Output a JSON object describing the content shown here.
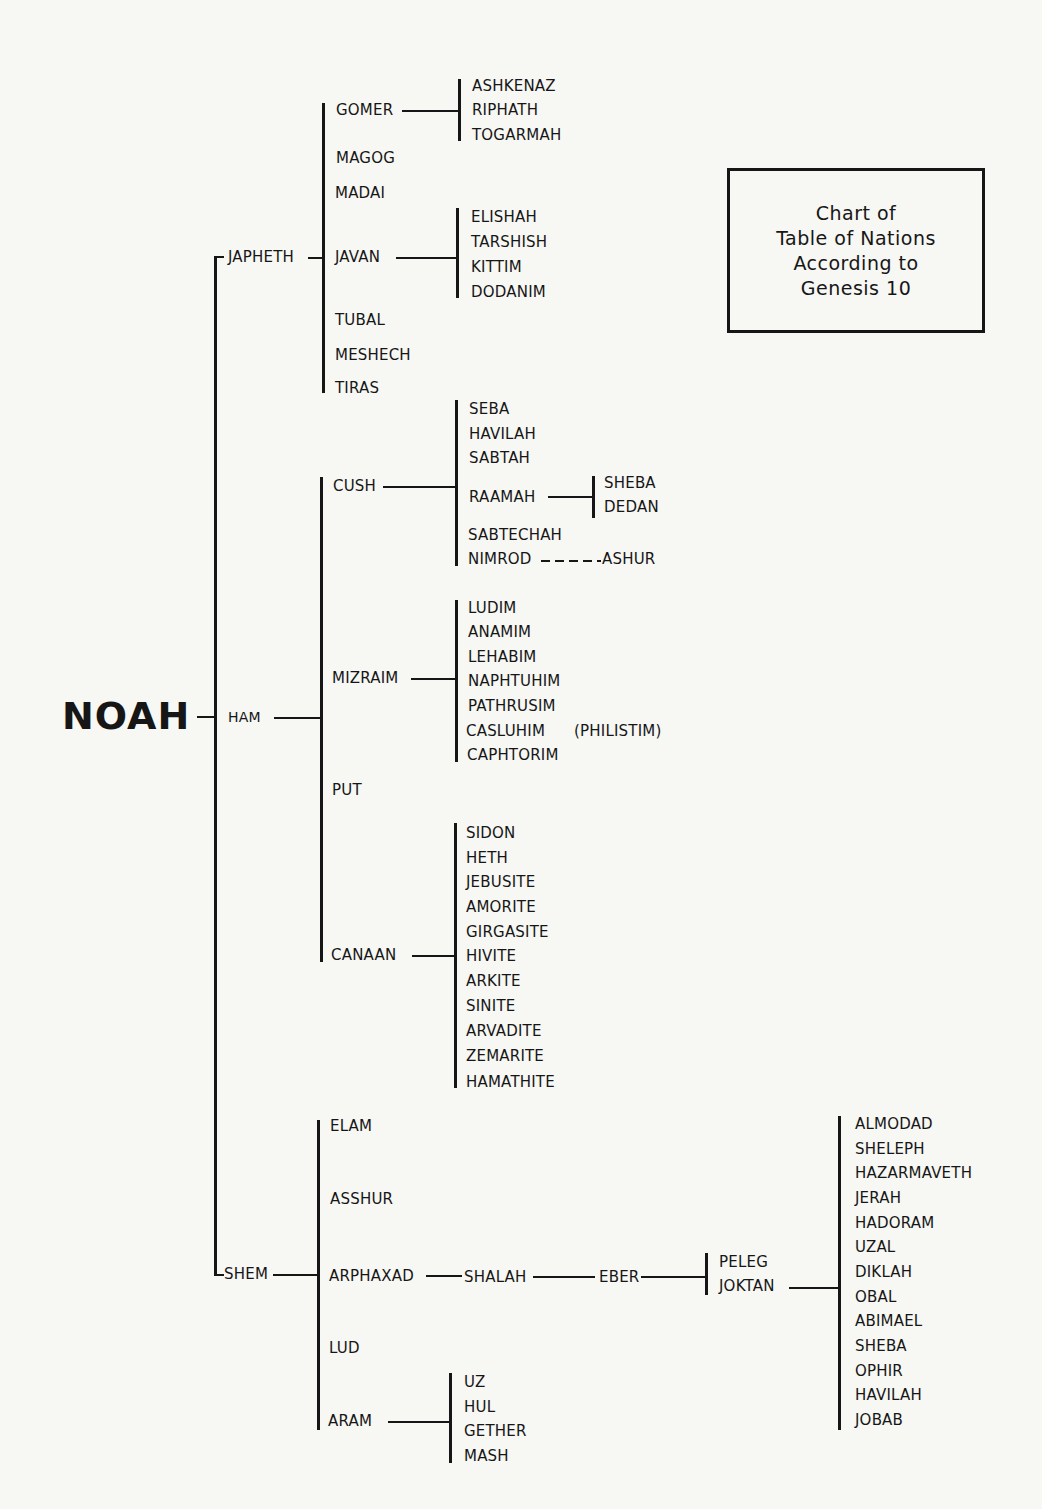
{
  "title_box": {
    "lines": [
      "Chart of",
      "Table of Nations",
      "According to",
      "Genesis 10"
    ]
  },
  "root": "NOAH",
  "sons": {
    "japheth": {
      "name": "JAPHETH",
      "children": {
        "gomer": {
          "name": "GOMER",
          "children": [
            "ASHKENAZ",
            "RIPHATH",
            "TOGARMAH"
          ]
        },
        "magog": {
          "name": "MAGOG"
        },
        "madai": {
          "name": "MADAI"
        },
        "javan": {
          "name": "JAVAN",
          "children": [
            "ELISHAH",
            "TARSHISH",
            "KITTIM",
            "DODANIM"
          ]
        },
        "tubal": {
          "name": "TUBAL"
        },
        "meshech": {
          "name": "MESHECH"
        },
        "tiras": {
          "name": "TIRAS"
        }
      }
    },
    "ham": {
      "name": "HAM",
      "children": {
        "cush": {
          "name": "CUSH",
          "children": [
            "SEBA",
            "HAVILAH",
            "SABTAH",
            "RAAMAH",
            "SABTECHAH",
            "NIMROD"
          ],
          "raamah_children": [
            "SHEBA",
            "DEDAN"
          ],
          "nimrod_link": "ASHUR"
        },
        "mizraim": {
          "name": "MIZRAIM",
          "children": [
            "LUDIM",
            "ANAMIM",
            "LEHABIM",
            "NAPHTUHIM",
            "PATHRUSIM",
            "CASLUHIM",
            "CAPHTORIM"
          ],
          "casluhim_note": "(PHILISTIM)"
        },
        "put": {
          "name": "PUT"
        },
        "canaan": {
          "name": "CANAAN",
          "children": [
            "SIDON",
            "HETH",
            "JEBUSITE",
            "AMORITE",
            "GIRGASITE",
            "HIVITE",
            "ARKITE",
            "SINITE",
            "ARVADITE",
            "ZEMARITE",
            "HAMATHITE"
          ]
        }
      }
    },
    "shem": {
      "name": "SHEM",
      "children": {
        "elam": {
          "name": "ELAM"
        },
        "asshur": {
          "name": "ASSHUR"
        },
        "arphaxad": {
          "name": "ARPHAXAD",
          "line": [
            "SHALAH",
            "EBER"
          ],
          "eber_children": [
            "PELEG",
            "JOKTAN"
          ]
        },
        "joktan_children": [
          "ALMODAD",
          "SHELEPH",
          "HAZARMAVETH",
          "JERAH",
          "HADORAM",
          "UZAL",
          "DIKLAH",
          "OBAL",
          "ABIMAEL",
          "SHEBA",
          "OPHIR",
          "HAVILAH",
          "JOBAB"
        ],
        "lud": {
          "name": "LUD"
        },
        "aram": {
          "name": "ARAM",
          "children": [
            "UZ",
            "HUL",
            "GETHER",
            "MASH"
          ]
        }
      }
    }
  }
}
